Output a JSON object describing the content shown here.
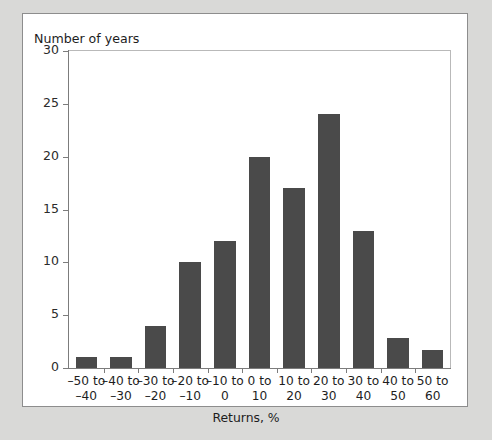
{
  "chart_data": {
    "type": "bar",
    "title": "",
    "ylabel": "Number of years",
    "xlabel": "Returns, %",
    "categories": [
      "–50 to\n–40",
      "–40 to\n–30",
      "–30 to\n–20",
      "–20 to\n–10",
      "–10 to\n0",
      "0 to\n10",
      "10 to\n20",
      "20 to\n30",
      "30 to\n40",
      "40 to\n50",
      "50 to\n60"
    ],
    "categories_lines": [
      [
        "–50 to",
        "–40"
      ],
      [
        "–40 to",
        "–30"
      ],
      [
        "–30 to",
        "–20"
      ],
      [
        "–20 to",
        "–10"
      ],
      [
        "–10 to",
        "0"
      ],
      [
        "0 to",
        "10"
      ],
      [
        "10 to",
        "20"
      ],
      [
        "20 to",
        "30"
      ],
      [
        "30 to",
        "40"
      ],
      [
        "40 to",
        "50"
      ],
      [
        "50 to",
        "60"
      ]
    ],
    "values": [
      1,
      1,
      4,
      10,
      12,
      20,
      17,
      24,
      13,
      2.8,
      1.7
    ],
    "ylim": [
      0,
      30
    ],
    "yticks": [
      0,
      5,
      10,
      15,
      20,
      25,
      30
    ],
    "ytick_labels": [
      "0",
      "5",
      "10",
      "15",
      "20",
      "25",
      "30"
    ],
    "grid": false,
    "legend": "none",
    "bar_color": "#4a4a4a",
    "axis_color": "#7c7c7c",
    "background": "#ffffff",
    "page_background": "#d9d9d7"
  }
}
